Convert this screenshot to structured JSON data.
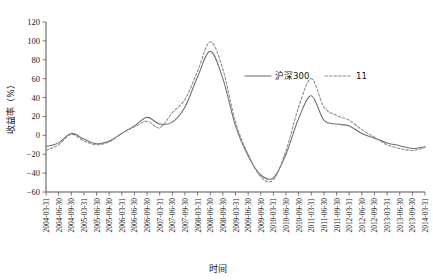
{
  "chart_data": {
    "type": "line",
    "title": "",
    "xlabel": "时间",
    "ylabel": "收益率（%）",
    "ylim": [
      -60,
      120
    ],
    "yticks": [
      -60,
      -40,
      -20,
      0,
      20,
      40,
      60,
      80,
      100,
      120
    ],
    "grid": false,
    "legend_position": "upper-right-inside",
    "categories": [
      "2004-03-31",
      "2004-06-30",
      "2004-09-30",
      "2005-03-31",
      "2005-06-30",
      "2005-09-30",
      "2006-03-31",
      "2006-06-30",
      "2006-09-30",
      "2007-03-31",
      "2007-06-30",
      "2007-09-30",
      "2008-03-31",
      "2008-06-30",
      "2008-09-30",
      "2009-03-31",
      "2009-06-30",
      "2009-09-30",
      "2010-03-31",
      "2010-06-30",
      "2010-09-30",
      "2011-03-31",
      "2011-06-30",
      "2011-09-30",
      "2012-03-31",
      "2012-06-30",
      "2012-09-30",
      "2013-03-31",
      "2013-06-30",
      "2013-09-30",
      "2014-03-31"
    ],
    "series": [
      {
        "name": "沪深300",
        "style": "solid",
        "color": "#6e6e6e",
        "values": [
          -12,
          -8,
          2,
          -4,
          -9,
          -6,
          2,
          10,
          19,
          12,
          14,
          30,
          62,
          89,
          60,
          10,
          -22,
          -42,
          -45,
          -20,
          18,
          42,
          16,
          12,
          10,
          2,
          -3,
          -8,
          -11,
          -14,
          -12
        ]
      },
      {
        "name": "11",
        "style": "dashed",
        "color": "#8a8a8a",
        "values": [
          -16,
          -10,
          1,
          -6,
          -10,
          -7,
          2,
          9,
          15,
          8,
          24,
          38,
          68,
          99,
          70,
          14,
          -20,
          -44,
          -47,
          -16,
          30,
          60,
          30,
          21,
          16,
          6,
          -2,
          -10,
          -14,
          -16,
          -13
        ]
      }
    ],
    "annotations": []
  },
  "legend": {
    "entries": [
      {
        "label": "沪深300",
        "style": "solid"
      },
      {
        "label": "11",
        "style": "dashed"
      }
    ]
  },
  "yaxis": {
    "labels": [
      "120",
      "100",
      "80",
      "60",
      "40",
      "20",
      "0",
      "−20",
      "−40",
      "−60"
    ],
    "title": "收益率（%）"
  },
  "xaxis": {
    "title": "时间",
    "labels": [
      "2004-03-31",
      "2004-06-30",
      "2004-09-30",
      "2005-03-31",
      "2005-06-30",
      "2005-09-30",
      "2006-03-31",
      "2006-06-30",
      "2006-09-30",
      "2007-03-31",
      "2007-06-30",
      "2007-09-30",
      "2008-03-31",
      "2008-06-30",
      "2008-09-30",
      "2009-03-31",
      "2009-06-30",
      "2009-09-30",
      "2010-03-31",
      "2010-06-30",
      "2010-09-30",
      "2011-03-31",
      "2011-06-30",
      "2011-09-30",
      "2012-03-31",
      "2012-06-30",
      "2012-09-30",
      "2013-03-31",
      "2013-06-30",
      "2013-09-30",
      "2014-03-31"
    ]
  }
}
